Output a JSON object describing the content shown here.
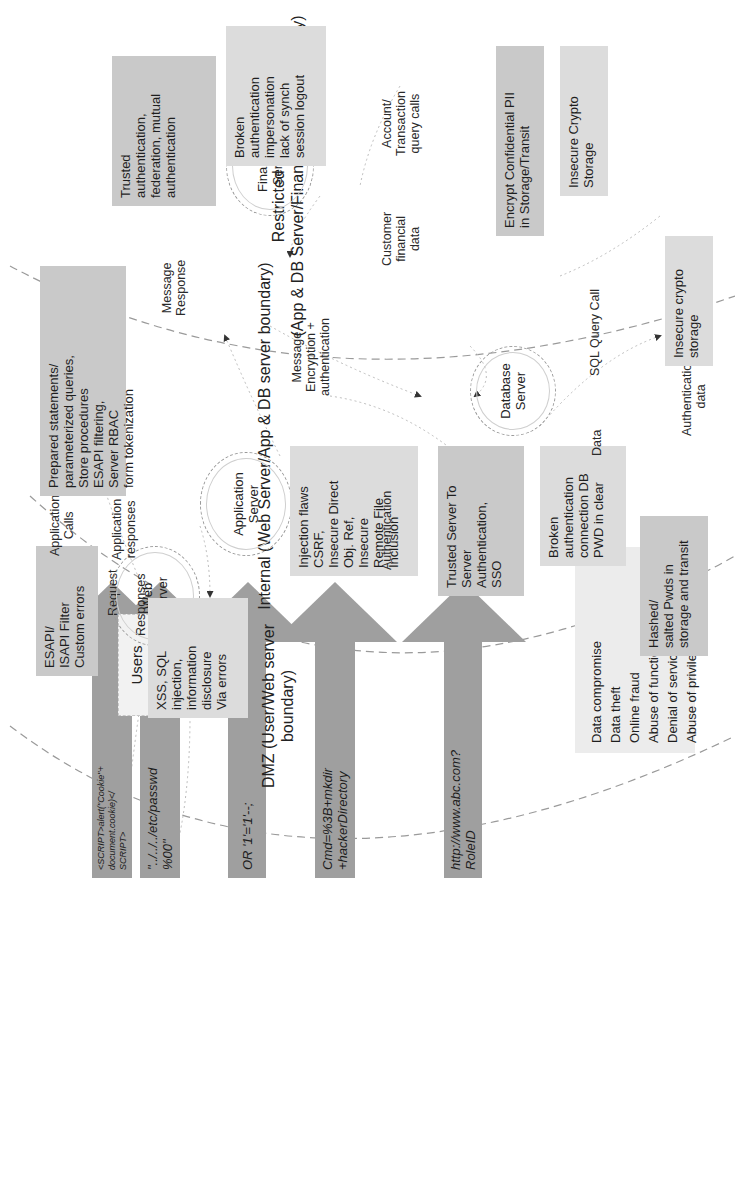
{
  "boundaries": {
    "restricted": "Restricted network\n(App & DB Server/Financial server boundary)",
    "internal": "Internal (Web Server/App & DB server boundary)",
    "dmz": "DMZ (User/Web server boundary)"
  },
  "servers": {
    "web": "Web\nServer",
    "application": "Application\nServer",
    "database": "Database\nServer",
    "financial": "Financial\nServer"
  },
  "users": {
    "label": "Users"
  },
  "attack_arrows": [
    {
      "payload": "<SCRIPT>alert(\"Cookie\"+\ndocument.cookie)</\nSCRIPT>"
    },
    {
      "payload": "\"../../../etc/passwd\n%00\""
    },
    {
      "payload": "OR '1'='1'--;"
    },
    {
      "payload": "Cmd=%3B+mkdir\n+hackerDirectory"
    },
    {
      "payload": "http://www.abc.com?\nRoleID"
    }
  ],
  "threats_list": {
    "items": "Data compromise\nData theft\nOnline fraud\nAbuse of functionality\nDenial of service\nAbuse of privileges"
  },
  "flow_labels": {
    "request": "Request",
    "responses": "Responses",
    "app_calls": "Application\nCalls",
    "app_responses": "Application\nresponses",
    "message_response": "Message\nResponse",
    "message_encryption": "Message\nEncryption +\nauthentication",
    "authentication": "Authentication",
    "sql_query_call": "SQL Query Call",
    "data": "Data",
    "authentication_data": "Authentication\ndata",
    "customer_financial_data": "Customer\nfinancial\ndata",
    "account_transaction_calls": "Account/\nTransaction\nquery calls"
  },
  "controls": {
    "web_filter": "ESAPI/\nISAPI Filter\nCustom errors",
    "prepared_statements": "Prepared statements/\nparameterized queries,\nStore procedures\nESAPI filtering,\nServer RBAC\nform tokenization",
    "trusted_server_auth": "Trusted Server To\nServer\nAuthentication,\nSSO",
    "hashed_pwds": "Hashed/\nsalted Pwds in\nstorage and transit",
    "trusted_federation": "Trusted\nauthentication,\nfederation, mutual\nauthentication",
    "encrypt_pii": "Encrypt Confidential PII\nin Storage/Transit"
  },
  "vulnerabilities": {
    "web": "XSS, SQL\ninjection,\ninformation\ndisclosure\nVia errors",
    "app": "Injection flaws\nCSRF,\nInsecure Direct\nObj. Ref,\nInsecure\nRemote File\nInclusion",
    "db_broken_auth": "Broken\nauthentication\nconnection DB\nPWD in clear",
    "insecure_crypto_db": "Insecure crypto\nstorage",
    "financial_broken_auth": "Broken\nauthentication\nimpersonation\nlack of synch\nsession logout",
    "insecure_crypto_fin": "Insecure Crypto\nStorage"
  }
}
